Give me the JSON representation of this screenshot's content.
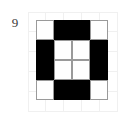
{
  "figure": {
    "index_label": "9",
    "title": ""
  },
  "colors": {
    "filled": "#000000",
    "empty": "#ffffff",
    "cell_border": "#9a9a9a",
    "background_gridline": "#f0f0f0",
    "page_background": "#ffffff",
    "label_text": "#3a3a3a"
  },
  "background_grid": {
    "rows": 5,
    "cols": 5,
    "cell_width": 18,
    "cell_height": 20,
    "left": 28,
    "top": 12
  },
  "chart_data": {
    "type": "heatmap",
    "title": "",
    "xlabel": "",
    "ylabel": "",
    "rows": 4,
    "cols": 4,
    "legend": [
      "empty",
      "filled"
    ],
    "value_labels": {
      "0": "empty",
      "1": "filled"
    },
    "matrix": [
      [
        0,
        1,
        1,
        0
      ],
      [
        1,
        0,
        0,
        1
      ],
      [
        1,
        0,
        0,
        1
      ],
      [
        0,
        1,
        1,
        0
      ]
    ]
  }
}
